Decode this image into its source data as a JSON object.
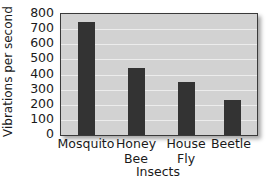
{
  "chart_data": {
    "type": "bar",
    "title": "",
    "xlabel": "Insects",
    "ylabel": "Vibrations per second",
    "categories": [
      "Mosquito",
      "Honey Bee",
      "House Fly",
      "Beetle"
    ],
    "category_lines": [
      [
        "Mosquito"
      ],
      [
        "Honey",
        "Bee"
      ],
      [
        "House",
        "Fly"
      ],
      [
        "Beetle"
      ]
    ],
    "values": [
      750,
      440,
      350,
      230
    ],
    "ylim": [
      0,
      800
    ],
    "yticks": [
      0,
      100,
      200,
      300,
      400,
      500,
      600,
      700,
      800
    ],
    "grid": true,
    "legend": null,
    "colors": {
      "bar": "#333333",
      "plot_bg": "#d2d2d2",
      "grid": "#ececec"
    }
  }
}
